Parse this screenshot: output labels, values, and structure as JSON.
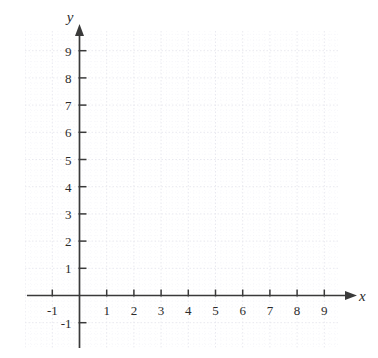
{
  "figure": {
    "kind": "cartesian-coordinate-grid",
    "background_color": "#ffffff",
    "axis_color": "#3a3a3a",
    "grid_major_color": "#e9e9ef",
    "grid_minor_color": "#f2f2f6",
    "label_color": "#2b2b2b"
  },
  "axes": {
    "x": {
      "name": "x",
      "tick_labels": [
        "-1",
        "1",
        "2",
        "3",
        "4",
        "5",
        "6",
        "7",
        "8",
        "9"
      ],
      "tick_values": [
        -1,
        1,
        2,
        3,
        4,
        5,
        6,
        7,
        8,
        9
      ],
      "min": -2,
      "max": 10,
      "arrow": "right"
    },
    "y": {
      "name": "y",
      "tick_labels": [
        "-1",
        "1",
        "2",
        "3",
        "4",
        "5",
        "6",
        "7",
        "8",
        "9"
      ],
      "tick_values": [
        -1,
        1,
        2,
        3,
        4,
        5,
        6,
        7,
        8,
        9
      ],
      "min": -2,
      "max": 10,
      "arrow": "up"
    },
    "origin_label": ""
  },
  "chart_data": {
    "type": "scatter",
    "title": "",
    "subtitle": "",
    "xlabel": "x",
    "ylabel": "y",
    "xlim": [
      -2,
      10
    ],
    "ylim": [
      -2,
      10
    ],
    "xticks": [
      -1,
      1,
      2,
      3,
      4,
      5,
      6,
      7,
      8,
      9
    ],
    "yticks": [
      -1,
      1,
      2,
      3,
      4,
      5,
      6,
      7,
      8,
      9
    ],
    "xtick_labels": [
      "-1",
      "1",
      "2",
      "3",
      "4",
      "5",
      "6",
      "7",
      "8",
      "9"
    ],
    "ytick_labels": [
      "-1",
      "1",
      "2",
      "3",
      "4",
      "5",
      "6",
      "7",
      "8",
      "9"
    ],
    "grid": true,
    "grid_style": "dotted",
    "minor_grid": true,
    "minor_grid_divisions": 5,
    "legend": null,
    "legend_position": "none",
    "series": [],
    "annotations": [],
    "note": "Empty blank graph paper: axes drawn with arrowheads, no plotted data"
  }
}
